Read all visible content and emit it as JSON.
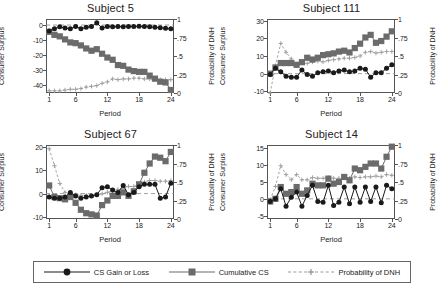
{
  "figure": {
    "xlabel": "Period",
    "ylabel_left": "Consumer Surplus",
    "ylabel_right": "Probability of DNH",
    "xticks": [
      "1",
      "6",
      "12",
      "18",
      "24"
    ],
    "xtick_values": [
      1,
      6,
      12,
      18,
      24
    ],
    "colors": {
      "cs_gain_loss": "#1a1a1a",
      "cumulative_cs": "#6b6b6b",
      "probability_dnh": "#9a9a9a",
      "axis": "#555555",
      "background": "#ffffff"
    }
  },
  "legend": {
    "position": "bottom",
    "items": [
      {
        "label": "CS Gain or Loss",
        "marker": "circle",
        "line": "solid",
        "color": "#1a1a1a"
      },
      {
        "label": "Cumulative CS",
        "marker": "square",
        "line": "solid",
        "color": "#6b6b6b"
      },
      {
        "label": "Probability of DNH",
        "marker": "cross",
        "line": "dashed",
        "color": "#9a9a9a"
      }
    ]
  },
  "chart_data": [
    {
      "type": "line",
      "title": "Subject 5",
      "xlabel": "Period",
      "ylabel": "Consumer Surplus",
      "ylabel_right": "Probability of DNH",
      "x": [
        1,
        2,
        3,
        4,
        5,
        6,
        7,
        8,
        9,
        10,
        11,
        12,
        13,
        14,
        15,
        16,
        17,
        18,
        19,
        20,
        21,
        22,
        23,
        24
      ],
      "xlim": [
        0.4,
        24.6
      ],
      "ylim": [
        -45,
        4
      ],
      "yticks": [
        0,
        -10,
        -20,
        -30,
        -40
      ],
      "ytick_labels": [
        "0",
        "-10",
        "-20",
        "-30",
        "-40"
      ],
      "ylim_right": [
        0,
        1
      ],
      "yticks_right": [
        1,
        0.75,
        0.5,
        0.25,
        0
      ],
      "ytick_labels_right": [
        "1",
        ".75",
        ".5",
        ".25",
        "0"
      ],
      "grid": false,
      "series": [
        {
          "name": "CS Gain or Loss",
          "axis": "left",
          "values": [
            -4.0,
            -2.5,
            -1.2,
            -2.0,
            -2.5,
            -1.0,
            -2.5,
            -1.5,
            -1.0,
            1.5,
            -2.0,
            -1.0,
            -1.2,
            -1.0,
            -1.2,
            -1.0,
            -0.9,
            -0.8,
            -0.9,
            -1.2,
            -1.5,
            -1.8,
            -2.2,
            -2.5
          ]
        },
        {
          "name": "Cumulative CS",
          "axis": "left",
          "values": [
            -4.5,
            -6.5,
            -7.5,
            -9.5,
            -11.5,
            -12.0,
            -13.5,
            -15.5,
            -17.0,
            -16.0,
            -19.0,
            -21.5,
            -23.0,
            -26.5,
            -27.0,
            -29.5,
            -30.5,
            -31.0,
            -31.0,
            -33.5,
            -35.5,
            -37.5,
            -38.0,
            -43.0
          ]
        },
        {
          "name": "Probability of DNH",
          "axis": "right",
          "values": [
            0.03,
            0.03,
            0.03,
            0.04,
            0.05,
            0.05,
            0.06,
            0.08,
            0.09,
            0.1,
            0.13,
            0.15,
            0.19,
            0.18,
            0.19,
            0.19,
            0.2,
            0.2,
            0.19,
            0.19,
            0.18,
            0.18,
            0.18,
            0.18
          ]
        }
      ]
    },
    {
      "type": "line",
      "title": "Subject 111",
      "xlabel": "Period",
      "ylabel": "Consumer Surplus",
      "ylabel_right": "Probability of DNH",
      "x": [
        1,
        2,
        3,
        4,
        5,
        6,
        7,
        8,
        9,
        10,
        11,
        12,
        13,
        14,
        15,
        16,
        17,
        18,
        19,
        20,
        21,
        22,
        23,
        24
      ],
      "xlim": [
        0.4,
        24.6
      ],
      "ylim": [
        -11,
        31
      ],
      "yticks": [
        30,
        20,
        10,
        0,
        -10
      ],
      "ytick_labels": [
        "30",
        "20",
        "10",
        "0",
        "-10"
      ],
      "ylim_right": [
        0,
        1
      ],
      "yticks_right": [
        1,
        0.75,
        0.5,
        0.25,
        0
      ],
      "ytick_labels_right": [
        "1",
        ".75",
        ".5",
        ".25",
        "0"
      ],
      "grid": false,
      "series": [
        {
          "name": "CS Gain or Loss",
          "axis": "left",
          "values": [
            -0.5,
            3.0,
            1.0,
            -1.5,
            -2.0,
            -2.0,
            2.0,
            -0.5,
            -1.5,
            0.5,
            1.0,
            1.5,
            0.5,
            1.5,
            2.0,
            1.0,
            1.5,
            3.0,
            2.5,
            -2.0,
            0.5,
            0.5,
            3.0,
            5.0
          ]
        },
        {
          "name": "Cumulative CS",
          "axis": "left",
          "values": [
            0.0,
            3.5,
            6.0,
            6.0,
            6.0,
            5.0,
            6.5,
            9.0,
            8.0,
            9.0,
            10.5,
            11.0,
            11.5,
            12.5,
            13.0,
            12.0,
            14.5,
            17.0,
            20.5,
            22.0,
            17.5,
            18.5,
            21.0,
            24.0
          ]
        },
        {
          "name": "Probability of DNH",
          "axis": "right",
          "values": [
            0.0,
            0.37,
            0.67,
            0.55,
            0.46,
            0.37,
            0.42,
            0.4,
            0.42,
            0.43,
            0.42,
            0.44,
            0.45,
            0.46,
            0.47,
            0.47,
            0.48,
            0.5,
            0.55,
            0.56,
            0.54,
            0.55,
            0.56,
            0.56
          ]
        }
      ]
    },
    {
      "type": "line",
      "title": "Subject 67",
      "xlabel": "Period",
      "ylabel": "Consumer Surplus",
      "ylabel_right": "Probability of DNH",
      "x": [
        1,
        2,
        3,
        4,
        5,
        6,
        7,
        8,
        9,
        10,
        11,
        12,
        13,
        14,
        15,
        16,
        17,
        18,
        19,
        20,
        21,
        22,
        23,
        24
      ],
      "xlim": [
        0.4,
        24.6
      ],
      "ylim": [
        -11,
        21
      ],
      "yticks": [
        20,
        10,
        0,
        -10
      ],
      "ytick_labels": [
        "20",
        "10",
        "0",
        "-10"
      ],
      "ylim_right": [
        0,
        1
      ],
      "yticks_right": [
        1,
        0.75,
        0.5,
        0.25,
        0
      ],
      "ytick_labels_right": [
        "1",
        ".75",
        ".5",
        ".25",
        "0"
      ],
      "grid": false,
      "series": [
        {
          "name": "CS Gain or Loss",
          "axis": "left",
          "values": [
            -1.5,
            -2.0,
            -2.0,
            -1.5,
            0.5,
            -1.0,
            -2.0,
            -1.5,
            -1.0,
            -0.5,
            2.5,
            3.0,
            1.5,
            0.5,
            3.5,
            -0.5,
            0.5,
            3.0,
            4.0,
            4.0,
            4.0,
            -2.0,
            -1.5,
            4.5
          ]
        },
        {
          "name": "Cumulative CS",
          "axis": "left",
          "values": [
            3.5,
            -1.5,
            -2.0,
            -2.5,
            -1.5,
            -4.0,
            -7.0,
            -8.5,
            -9.0,
            -9.5,
            -5.0,
            -3.0,
            -1.0,
            -1.0,
            0.5,
            -1.0,
            1.0,
            4.0,
            9.0,
            13.0,
            16.0,
            15.5,
            14.0,
            18.0
          ]
        },
        {
          "name": "Probability of DNH",
          "axis": "right",
          "values": [
            0.95,
            0.72,
            0.48,
            0.36,
            0.34,
            0.33,
            0.32,
            0.32,
            0.32,
            0.33,
            0.34,
            0.36,
            0.38,
            0.4,
            0.42,
            0.44,
            0.44,
            0.46,
            0.5,
            0.52,
            0.52,
            0.51,
            0.51,
            0.52
          ]
        }
      ]
    },
    {
      "type": "line",
      "title": "Subject 14",
      "xlabel": "Period",
      "ylabel": "Consumer Surplus",
      "ylabel_right": "Probability of DNH",
      "x": [
        1,
        2,
        3,
        4,
        5,
        6,
        7,
        8,
        9,
        10,
        11,
        12,
        13,
        14,
        15,
        16,
        17,
        18,
        19,
        20,
        21,
        22,
        23,
        24
      ],
      "xlim": [
        0.4,
        24.6
      ],
      "ylim": [
        -6,
        16
      ],
      "yticks": [
        15,
        10,
        5,
        0,
        -5
      ],
      "ytick_labels": [
        "15",
        "10",
        "5",
        "0",
        "-5"
      ],
      "ylim_right": [
        0,
        1
      ],
      "yticks_right": [
        1,
        0.75,
        0.5,
        0.25,
        0
      ],
      "ytick_labels_right": [
        "1",
        ".75",
        ".5",
        ".25",
        "0"
      ],
      "grid": false,
      "series": [
        {
          "name": "CS Gain or Loss",
          "axis": "left",
          "values": [
            -0.8,
            0.0,
            3.0,
            -2.2,
            0.5,
            2.0,
            -2.2,
            1.0,
            4.0,
            -0.8,
            -1.0,
            4.0,
            -2.0,
            -1.0,
            3.5,
            -1.5,
            3.5,
            -1.0,
            3.5,
            -0.8,
            3.5,
            -1.2,
            4.0,
            3.0
          ]
        },
        {
          "name": "Cumulative CS",
          "axis": "left",
          "values": [
            -0.8,
            0.0,
            3.5,
            1.5,
            2.0,
            3.5,
            1.5,
            2.5,
            4.5,
            4.0,
            4.0,
            6.0,
            4.5,
            5.0,
            6.5,
            5.5,
            9.0,
            8.5,
            9.5,
            10.5,
            10.5,
            9.0,
            12.5,
            15.5
          ]
        },
        {
          "name": "Probability of DNH",
          "axis": "right",
          "values": [
            0.26,
            0.44,
            0.72,
            0.6,
            0.53,
            0.6,
            0.53,
            0.53,
            0.56,
            0.55,
            0.55,
            0.56,
            0.55,
            0.55,
            0.56,
            0.55,
            0.57,
            0.56,
            0.57,
            0.57,
            0.58,
            0.57,
            0.6,
            0.59
          ]
        }
      ]
    }
  ]
}
